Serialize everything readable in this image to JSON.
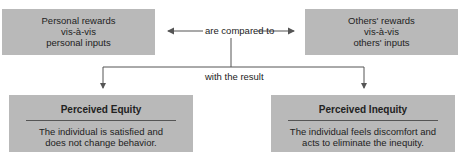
{
  "diagram": {
    "personal_box": {
      "lines": [
        "Personal rewards",
        "vis-à-vis",
        "personal inputs"
      ]
    },
    "others_box": {
      "lines": [
        "Others' rewards",
        "vis-à-vis",
        "others' inputs"
      ]
    },
    "compare_label": "are compared to",
    "result_label": "with the result",
    "equity_box": {
      "title": "Perceived Equity",
      "lines": [
        "The individual is satisfied and",
        "does not change behavior."
      ]
    },
    "inequity_box": {
      "title": "Perceived Inequity",
      "lines": [
        "The individual feels discomfort and",
        "acts to eliminate the inequity."
      ]
    },
    "colors": {
      "box": "#b9b9b9",
      "line": "#555555"
    }
  }
}
